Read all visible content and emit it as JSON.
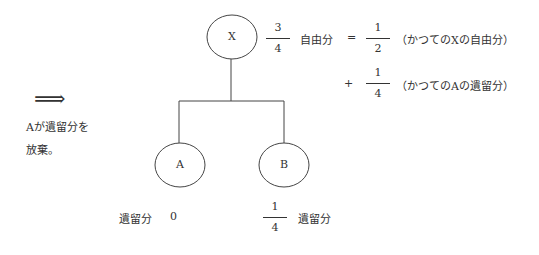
{
  "nodes": {
    "x": {
      "label": "X"
    },
    "a": {
      "label": "A"
    },
    "b": {
      "label": "B"
    }
  },
  "arrow": {
    "symbol": "⟹",
    "caption_line1": "Aが遺留分を",
    "caption_line2": "放棄。"
  },
  "x_share": {
    "fraction": {
      "num": "3",
      "den": "4"
    },
    "label": "自由分",
    "equals": "=",
    "term1": {
      "fraction": {
        "num": "1",
        "den": "2"
      },
      "note": "（かつてのXの自由分）"
    },
    "plus": "+",
    "term2": {
      "fraction": {
        "num": "1",
        "den": "4"
      },
      "note": "（かつてのAの遺留分）"
    }
  },
  "a_share": {
    "label": "遺留分",
    "value": "0"
  },
  "b_share": {
    "fraction": {
      "num": "1",
      "den": "4"
    },
    "label": "遺留分"
  }
}
